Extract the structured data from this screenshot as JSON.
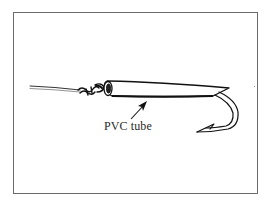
{
  "figure": {
    "label": "PVC tube",
    "components": [
      "fishing-line",
      "knot",
      "pvc-tube",
      "hook",
      "pointer-arrow"
    ],
    "colors": {
      "ink": "#1a1a1a",
      "frame": "#6b6b6b",
      "background": "#ffffff"
    }
  }
}
